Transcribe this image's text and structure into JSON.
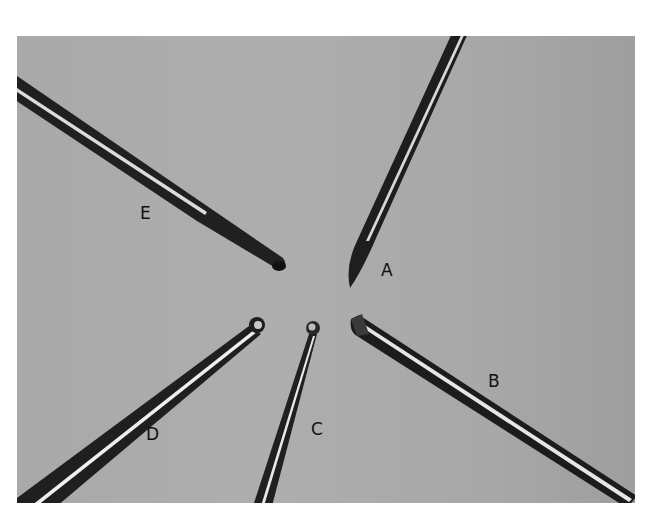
{
  "figure": {
    "background_color": "#aaaaaa",
    "instruments": [
      {
        "label": "A",
        "tip": "sharp curved blade"
      },
      {
        "label": "B",
        "tip": "forked / slotted tip"
      },
      {
        "label": "C",
        "tip": "ball tip"
      },
      {
        "label": "D",
        "tip": "ring / loop tip"
      },
      {
        "label": "E",
        "tip": "hooked tip"
      }
    ]
  }
}
